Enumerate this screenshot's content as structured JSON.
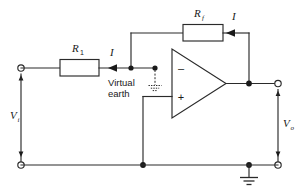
{
  "figure": {
    "name": "inverting-operational-amplifier-circuit",
    "background_color": "#ffffff",
    "line_color": "#2a2a2a"
  },
  "components": {
    "input_resistor": {
      "label": "R",
      "subscript": "1",
      "name": "resistor-r1"
    },
    "feedback_resistor": {
      "label": "R",
      "subscript": "f",
      "name": "resistor-rf"
    },
    "opamp": {
      "inverting_sign": "–",
      "noninverting_sign": "+",
      "name": "operational-amplifier"
    }
  },
  "labels": {
    "input_voltage": "V",
    "input_voltage_sub": "i",
    "output_voltage": "V",
    "output_voltage_sub": "o",
    "current_input": "I",
    "current_feedback": "I",
    "virtual_earth_line1": "Virtual",
    "virtual_earth_line2": "earth"
  },
  "terminals": {
    "input_positive": "input-terminal-top",
    "input_negative": "input-terminal-bottom",
    "output_positive": "output-terminal-top",
    "output_negative": "output-terminal-bottom"
  },
  "ground": {
    "main": "ground-symbol",
    "virtual": "virtual-earth-ground-symbol"
  }
}
